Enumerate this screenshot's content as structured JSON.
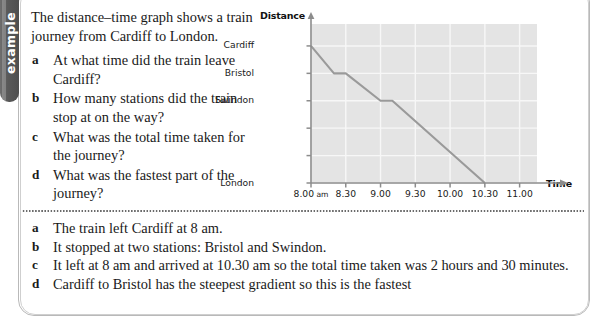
{
  "tab": {
    "label": "example"
  },
  "question": {
    "intro": "The distance–time graph shows a train journey from Cardiff to London.",
    "items": [
      {
        "marker": "a",
        "text": "At what time did the train leave Cardiff?"
      },
      {
        "marker": "b",
        "text": "How many stations did the train stop at on the way?"
      },
      {
        "marker": "c",
        "text": "What was the total time taken for the journey?"
      },
      {
        "marker": "d",
        "text": "What was the fastest part of the journey?"
      }
    ]
  },
  "answers": {
    "items": [
      {
        "marker": "a",
        "text": "The train left Cardiff at 8 am."
      },
      {
        "marker": "b",
        "text": "It stopped at two stations: Bristol and Swindon."
      },
      {
        "marker": "c",
        "text": "It left at 8 am and arrived at 10.30 am so the total time taken was 2 hours and 30 minutes."
      },
      {
        "marker": "d",
        "text": "Cardiff to Bristol has the steepest gradient so this is the fastest"
      }
    ]
  },
  "chart_data": {
    "type": "line",
    "title": "",
    "xlabel": "Time",
    "ylabel": "Distance",
    "grid": true,
    "legend": null,
    "plot_bg": "#e4e4e4",
    "grid_color": "#f7f7f7",
    "line_color": "#9a9a9a",
    "axis_color": "#8c8c8c",
    "x_ticks": [
      "8.00 am",
      "8.30",
      "9.00",
      "9.30",
      "10.00",
      "10.30",
      "11.00"
    ],
    "x_tick_values": [
      8.0,
      8.5,
      9.0,
      9.5,
      10.0,
      10.5,
      11.0
    ],
    "xlim": [
      8.0,
      11.25
    ],
    "y_ticks": [
      "Cardiff",
      "Bristol",
      "Swindon",
      "",
      "",
      "London"
    ],
    "y_tick_values": [
      5,
      4,
      3,
      2,
      1,
      0
    ],
    "ylim": [
      0,
      5.8
    ],
    "series": [
      {
        "name": "Train journey Cardiff to London",
        "x": [
          8.0,
          8.33,
          8.5,
          9.0,
          9.17,
          10.5
        ],
        "y": [
          5,
          4,
          4,
          3,
          3,
          0
        ],
        "points": [
          {
            "time": "8.00 am",
            "station": "Cardiff"
          },
          {
            "time": "8.20 am",
            "station": "Bristol"
          },
          {
            "time": "8.30 am",
            "station": "Bristol"
          },
          {
            "time": "9.00 am",
            "station": "Swindon"
          },
          {
            "time": "9.10 am",
            "station": "Swindon"
          },
          {
            "time": "10.30 am",
            "station": "London"
          }
        ]
      }
    ]
  }
}
